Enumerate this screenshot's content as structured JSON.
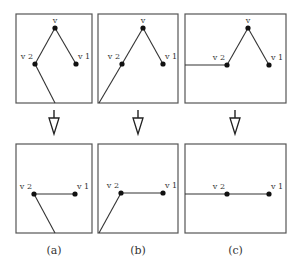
{
  "figure": {
    "panels": [
      {
        "id": "a",
        "caption": "(a)",
        "before": {
          "box": [
            16,
            14,
            76,
            89
          ],
          "vertices": [
            {
              "name": "v",
              "label": "v",
              "x": 55,
              "y": 28
            },
            {
              "name": "v2",
              "label": "v 2",
              "x": 35,
              "y": 64
            },
            {
              "name": "v1",
              "label": "v 1",
              "x": 76,
              "y": 64
            }
          ],
          "edges": [
            [
              55,
              28,
              35,
              64
            ],
            [
              55,
              28,
              76,
              64
            ],
            [
              35,
              64,
              55,
              103
            ]
          ]
        },
        "after": {
          "box": [
            16,
            144,
            76,
            89
          ],
          "vertices": [
            {
              "name": "v2",
              "label": "v 2",
              "x": 34,
              "y": 194
            },
            {
              "name": "v1",
              "label": "v 1",
              "x": 75,
              "y": 194
            }
          ],
          "edges": [
            [
              34,
              194,
              75,
              194
            ],
            [
              34,
              194,
              55,
              233
            ]
          ]
        },
        "arrow_x": 54
      },
      {
        "id": "b",
        "caption": "(b)",
        "before": {
          "box": [
            98,
            14,
            80,
            89
          ],
          "vertices": [
            {
              "name": "v",
              "label": "v",
              "x": 143,
              "y": 28
            },
            {
              "name": "v2",
              "label": "v 2",
              "x": 122,
              "y": 64
            },
            {
              "name": "v1",
              "label": "v 1",
              "x": 163,
              "y": 64
            }
          ],
          "edges": [
            [
              143,
              28,
              122,
              64
            ],
            [
              143,
              28,
              163,
              64
            ],
            [
              122,
              64,
              99,
              103
            ]
          ]
        },
        "after": {
          "box": [
            98,
            144,
            80,
            89
          ],
          "vertices": [
            {
              "name": "v2",
              "label": "v 2",
              "x": 121,
              "y": 193
            },
            {
              "name": "v1",
              "label": "v 1",
              "x": 163,
              "y": 193
            }
          ],
          "edges": [
            [
              121,
              193,
              163,
              193
            ],
            [
              121,
              193,
              99,
              233
            ]
          ]
        },
        "arrow_x": 138
      },
      {
        "id": "c",
        "caption": "(c)",
        "before": {
          "box": [
            185,
            14,
            101,
            89
          ],
          "vertices": [
            {
              "name": "v",
              "label": "v",
              "x": 248,
              "y": 28
            },
            {
              "name": "v2",
              "label": "v 2",
              "x": 227,
              "y": 65
            },
            {
              "name": "v1",
              "label": "v 1",
              "x": 269,
              "y": 65
            }
          ],
          "edges": [
            [
              248,
              28,
              227,
              65
            ],
            [
              248,
              28,
              269,
              65
            ],
            [
              185,
              65,
              227,
              65
            ]
          ]
        },
        "after": {
          "box": [
            185,
            144,
            101,
            89
          ],
          "vertices": [
            {
              "name": "v2",
              "label": "v 2",
              "x": 227,
              "y": 194
            },
            {
              "name": "v1",
              "label": "v 1",
              "x": 269,
              "y": 194
            }
          ],
          "edges": [
            [
              185,
              194,
              269,
              194
            ]
          ]
        },
        "arrow_x": 235
      }
    ]
  }
}
